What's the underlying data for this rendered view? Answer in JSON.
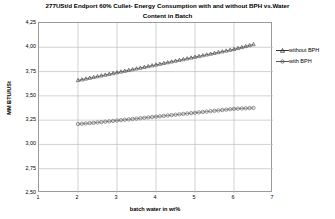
{
  "chart_data": {
    "type": "scatter",
    "title": "277USt/d Endport 60% Cullet- Energy Consumption with and without BPH vs.Water Content in Batch",
    "title_line1": "277USt/d Endport 60% Cullet- Energy Consumption with and without BPH vs.Water",
    "title_line2": "Content in Batch",
    "xlabel": "batch water in wt%",
    "ylabel": "MM BTU/USt",
    "xlim": [
      1,
      7
    ],
    "ylim": [
      2.5,
      4.25
    ],
    "xticks": [
      1,
      2,
      3,
      4,
      5,
      6,
      7
    ],
    "xtick_labels": [
      "1",
      "2",
      "3",
      "4",
      "5",
      "6",
      "7"
    ],
    "yticks": [
      2.5,
      2.75,
      3.0,
      3.25,
      3.5,
      3.75,
      4.0,
      4.25
    ],
    "ytick_labels": [
      "2,50",
      "2,75",
      "3,00",
      "3,25",
      "3,50",
      "3,75",
      "4,00",
      "4,25"
    ],
    "grid": true,
    "grid_x": true,
    "grid_y": true,
    "legend_position": "right",
    "series": [
      {
        "name": "without BPH",
        "marker": "triangle-open",
        "color": "#333333",
        "x": [
          2.0,
          2.1,
          2.2,
          2.3,
          2.4,
          2.5,
          2.6,
          2.7,
          2.8,
          2.9,
          3.0,
          3.1,
          3.2,
          3.3,
          3.4,
          3.5,
          3.6,
          3.7,
          3.8,
          3.9,
          4.0,
          4.1,
          4.2,
          4.3,
          4.4,
          4.5,
          4.6,
          4.7,
          4.8,
          4.9,
          5.0,
          5.1,
          5.2,
          5.3,
          5.4,
          5.5,
          5.6,
          5.7,
          5.8,
          5.9,
          6.0,
          6.1,
          6.2,
          6.3,
          6.4,
          6.5
        ],
        "y": [
          3.66,
          3.668,
          3.676,
          3.684,
          3.692,
          3.7,
          3.708,
          3.716,
          3.724,
          3.732,
          3.74,
          3.748,
          3.756,
          3.764,
          3.772,
          3.78,
          3.788,
          3.796,
          3.804,
          3.812,
          3.82,
          3.828,
          3.836,
          3.844,
          3.852,
          3.86,
          3.868,
          3.876,
          3.884,
          3.892,
          3.9,
          3.908,
          3.916,
          3.924,
          3.932,
          3.94,
          3.948,
          3.956,
          3.964,
          3.972,
          3.98,
          3.99,
          4.0,
          4.01,
          4.02,
          4.03
        ]
      },
      {
        "name": "with BPH",
        "marker": "circle-open",
        "color": "#555555",
        "x": [
          2.0,
          2.1,
          2.2,
          2.3,
          2.4,
          2.5,
          2.6,
          2.7,
          2.8,
          2.9,
          3.0,
          3.1,
          3.2,
          3.3,
          3.4,
          3.5,
          3.6,
          3.7,
          3.8,
          3.9,
          4.0,
          4.1,
          4.2,
          4.3,
          4.4,
          4.5,
          4.6,
          4.7,
          4.8,
          4.9,
          5.0,
          5.1,
          5.2,
          5.3,
          5.4,
          5.5,
          5.6,
          5.7,
          5.8,
          5.9,
          6.0,
          6.1,
          6.2,
          6.3,
          6.4,
          6.5
        ],
        "y": [
          3.21,
          3.213,
          3.216,
          3.219,
          3.222,
          3.226,
          3.23,
          3.234,
          3.238,
          3.242,
          3.246,
          3.25,
          3.254,
          3.258,
          3.262,
          3.266,
          3.27,
          3.274,
          3.278,
          3.282,
          3.286,
          3.29,
          3.294,
          3.298,
          3.302,
          3.306,
          3.31,
          3.314,
          3.318,
          3.322,
          3.326,
          3.33,
          3.334,
          3.338,
          3.342,
          3.346,
          3.35,
          3.354,
          3.358,
          3.362,
          3.366,
          3.368,
          3.37,
          3.372,
          3.374,
          3.376
        ]
      }
    ]
  },
  "legend": {
    "items": [
      {
        "label": "without BPH"
      },
      {
        "label": "with BPH"
      }
    ]
  },
  "colors": {
    "plot_border": "#9a9a9a",
    "gridline": "#bdbdbd",
    "series_without_bph": "#333333",
    "series_with_bph": "#555555",
    "background": "#ffffff",
    "text": "#000000"
  }
}
